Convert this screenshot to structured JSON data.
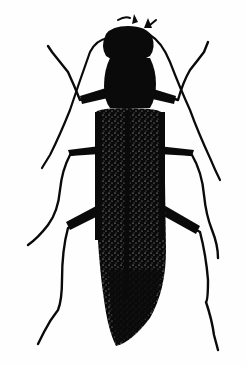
{
  "image": {
    "subject": "beetle illustration",
    "style": "black and white engraving",
    "background_color": "#ffffff",
    "ink_color": "#0a0a0a",
    "highlight_color": "#d8d8d8"
  }
}
